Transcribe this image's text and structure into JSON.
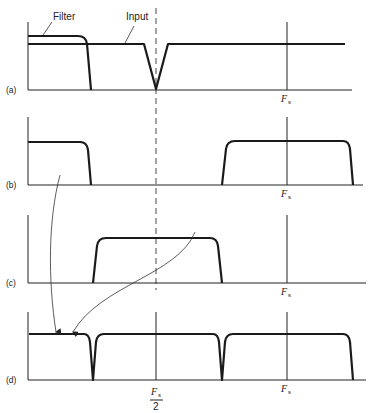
{
  "figure": {
    "annotations": {
      "filter_label": "Filter",
      "input_label": "Input"
    },
    "panels": [
      {
        "id": "a",
        "label": "(a)",
        "fs_label": "F",
        "fs_sub": "s"
      },
      {
        "id": "b",
        "label": "(b)",
        "fs_label": "F",
        "fs_sub": "s"
      },
      {
        "id": "c",
        "label": "(c)",
        "fs_label": "F",
        "fs_sub": "s"
      },
      {
        "id": "d",
        "label": "(d)",
        "fs_label": "F",
        "fs_sub": "s",
        "half_fs_numerator": "F",
        "half_fs_numerator_sub": "s",
        "half_fs_denominator": "2"
      }
    ],
    "colors": {
      "ink": "#1a1a1a",
      "background": "#ffffff"
    }
  }
}
